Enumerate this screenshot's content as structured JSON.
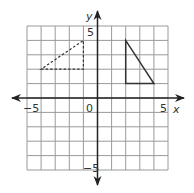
{
  "diagram": {
    "type": "coordinate-plane",
    "x_range": [
      -5,
      5
    ],
    "y_range": [
      -5,
      5
    ],
    "grid_step": 1,
    "axis_labels": {
      "x": "x",
      "y": "y"
    },
    "tick_labels": {
      "x_min": "−5",
      "x_max": "5",
      "origin": "0",
      "y_max": "5",
      "y_min": "−5"
    },
    "shapes": [
      {
        "name": "image-triangle",
        "style": "solid",
        "vertices": [
          [
            2,
            4
          ],
          [
            2,
            1
          ],
          [
            4,
            1
          ]
        ]
      },
      {
        "name": "preimage-triangle",
        "style": "dashed",
        "vertices": [
          [
            -4,
            2
          ],
          [
            -1,
            2
          ],
          [
            -1,
            4
          ]
        ]
      }
    ],
    "colors": {
      "grid": "#9a9a9a",
      "axis": "#222222",
      "shape": "#333333"
    }
  }
}
